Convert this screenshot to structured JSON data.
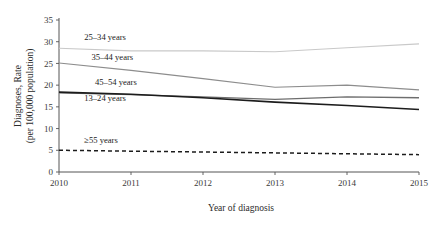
{
  "chart_data": {
    "type": "line",
    "title": "",
    "xlabel": "Year of diagnosis",
    "ylabel_line1": "Diagnoses, Rate",
    "ylabel_line2": "(per 100,000 population)",
    "x": [
      2010,
      2011,
      2012,
      2013,
      2014,
      2015
    ],
    "xtick_labels": [
      "2010",
      "2011",
      "2012",
      "2013",
      "2014",
      "2015"
    ],
    "ytick_labels": [
      "0",
      "5",
      "10",
      "15",
      "20",
      "25",
      "30",
      "35"
    ],
    "ytick_values": [
      0,
      5,
      10,
      15,
      20,
      25,
      30,
      35
    ],
    "ylim": [
      0,
      35
    ],
    "xlim": [
      2010,
      2015
    ],
    "grid": false,
    "legend_position": "inline-labels",
    "series": [
      {
        "name": "25–34 years",
        "values": [
          28.5,
          27.9,
          27.9,
          27.7,
          28.6,
          29.5
        ],
        "color": "#c9c9c9",
        "width": 1.1,
        "dash": "none",
        "label_x": 2010.35,
        "label_y": 30.3
      },
      {
        "name": "35–44 years",
        "values": [
          25.1,
          23.4,
          21.5,
          19.5,
          20.0,
          18.9
        ],
        "color": "#8d8d8d",
        "width": 1.1,
        "dash": "none",
        "label_x": 2010.45,
        "label_y": 25.9
      },
      {
        "name": "45–54 years",
        "values": [
          18.2,
          17.8,
          17.3,
          16.7,
          17.3,
          17.1
        ],
        "color": "#6e6e6e",
        "width": 1.3,
        "dash": "none",
        "label_x": 2010.5,
        "label_y": 20.1
      },
      {
        "name": "13–24 years",
        "values": [
          18.4,
          17.9,
          17.1,
          16.1,
          15.3,
          14.4
        ],
        "color": "#1c1c1c",
        "width": 1.6,
        "dash": "none",
        "label_x": 2010.35,
        "label_y": 16.3
      },
      {
        "name": "≥55 years",
        "values": [
          5.0,
          4.8,
          4.6,
          4.4,
          4.2,
          4.0
        ],
        "color": "#1c1c1c",
        "width": 1.5,
        "dash": "4,3",
        "label_x": 2010.35,
        "label_y": 6.6
      }
    ]
  }
}
